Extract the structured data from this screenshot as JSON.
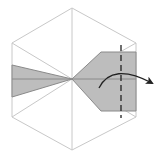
{
  "diagram": {
    "colors": {
      "background": "#ffffff",
      "outline": "#c8c8c8",
      "paper_fill": "#bdbdbd",
      "paper_edge": "#8a8a8a",
      "fold_line": "#222222",
      "arrow": "#222222"
    },
    "elements": {
      "hexagon": "hexagon-outline",
      "left_flap": "left-triangular-flap",
      "right_flap": "right-pentagonal-flap",
      "fold_line": "dashed-valley-fold-line",
      "arrow": "curved-fold-arrow"
    }
  }
}
